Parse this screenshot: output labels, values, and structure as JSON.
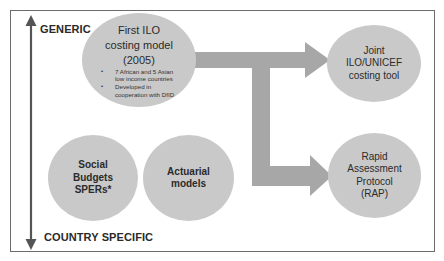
{
  "axis": {
    "top_label": "GENERIC",
    "bottom_label": "COUNTRY SPECIFIC"
  },
  "nodes": {
    "first_ilo": {
      "title_lines": [
        "First ILO",
        "costing model",
        "(2005)"
      ],
      "bullets": [
        "7 African and 5 Asian low income countries",
        "Developed in cooperation with DfID"
      ]
    },
    "joint": {
      "title_lines": [
        "Joint",
        "ILO/UNICEF",
        "costing tool"
      ]
    },
    "rap": {
      "title_lines": [
        "Rapid",
        "Assessment",
        "Protocol",
        "(RAP)"
      ]
    },
    "social_budgets": {
      "title_lines": [
        "Social",
        "Budgets",
        "SPERs*"
      ]
    },
    "actuarial": {
      "title_lines": [
        "Actuarial",
        "models"
      ]
    }
  },
  "colors": {
    "circle_fill": "#c9c9c9",
    "arrow_fill": "#a7a7a7",
    "axis_arrow": "#555555",
    "frame": "#6b6b6b"
  }
}
